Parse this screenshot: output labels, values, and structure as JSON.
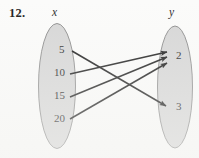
{
  "exercise": {
    "number": "12."
  },
  "diagram": {
    "domain_label": "x",
    "range_label": "y",
    "domain_elements": [
      {
        "value": "5",
        "x": 59,
        "y": 50
      },
      {
        "value": "10",
        "x": 54,
        "y": 73
      },
      {
        "value": "15",
        "x": 54,
        "y": 96
      },
      {
        "value": "20",
        "x": 54,
        "y": 119
      }
    ],
    "range_elements": [
      {
        "value": "2",
        "x": 176,
        "y": 56
      },
      {
        "value": "3",
        "x": 176,
        "y": 107
      }
    ],
    "mappings": [
      {
        "from": "5",
        "to": "3",
        "x1": 72,
        "y1": 51,
        "x2": 166,
        "y2": 106
      },
      {
        "from": "10",
        "to": "2",
        "x1": 70,
        "y1": 74,
        "x2": 167,
        "y2": 52
      },
      {
        "from": "15",
        "to": "2",
        "x1": 70,
        "y1": 97,
        "x2": 167,
        "y2": 57
      },
      {
        "from": "20",
        "to": "2",
        "x1": 70,
        "y1": 119,
        "x2": 167,
        "y2": 63
      }
    ],
    "ovals": [
      {
        "name": "domain-oval",
        "cx": 57,
        "cy": 86,
        "rx": 18.5,
        "ry": 62.5
      },
      {
        "name": "range-oval",
        "cx": 175,
        "cy": 87,
        "rx": 17.5,
        "ry": 61
      }
    ],
    "colors": {
      "oval_fill": "#d6d6d6",
      "oval_stroke": "#8d8d8d",
      "arrow": "#1a1a1a",
      "text": "#1d1d1d",
      "background": "#fbfbfa"
    }
  }
}
